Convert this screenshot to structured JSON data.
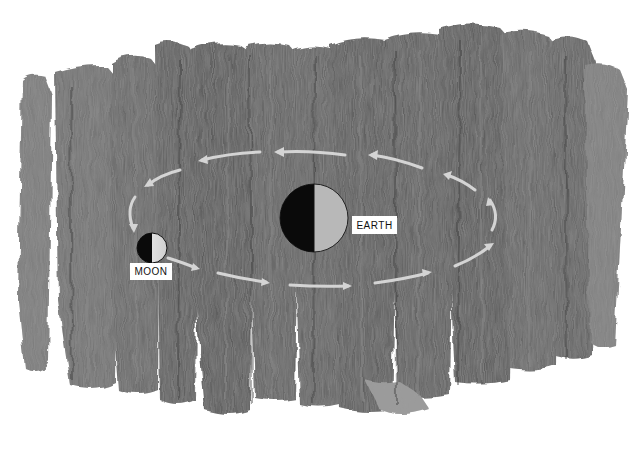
{
  "diagram": {
    "type": "orbit-illustration",
    "background": "grey painted brushstrokes on white",
    "bodies": [
      {
        "id": "earth",
        "label": "EARTH",
        "cx": 314,
        "cy": 218,
        "r": 34,
        "dark_side": "left",
        "dark_color": "#0a0a0a",
        "light_color": "#b8b8b8"
      },
      {
        "id": "moon",
        "label": "MOON",
        "cx": 152,
        "cy": 248,
        "r": 15,
        "dark_side": "left",
        "dark_color": "#0a0a0a",
        "light_color": "#e8e8e8"
      }
    ],
    "orbit": {
      "direction": "counterclockwise",
      "arrow_color": "#d0d0d0",
      "arrow_count": 12
    }
  },
  "labels": {
    "earth": "EARTH",
    "moon": "MOON"
  },
  "colors": {
    "paint_dark": "#4a4a4a",
    "paint_mid": "#6e6e6e",
    "paint_light": "#8c8c8c",
    "paper": "#ffffff"
  }
}
